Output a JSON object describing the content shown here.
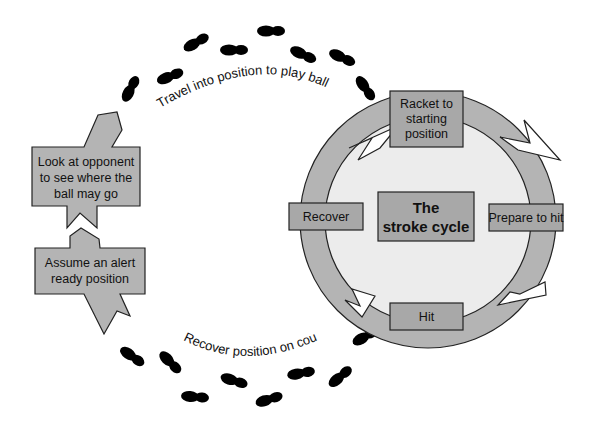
{
  "colors": {
    "box_fill": "#a8a8a8",
    "arrow_fill": "#b4b4b4",
    "inner_circle": "#ececec",
    "outline": "#222222",
    "footprint": "#000000"
  },
  "cycle": {
    "center_title_line1": "The",
    "center_title_line2": "stroke cycle",
    "steps": [
      {
        "id": "racket",
        "lines": [
          "Racket to",
          "starting",
          "position"
        ]
      },
      {
        "id": "prepare",
        "lines": [
          "Prepare to hit"
        ]
      },
      {
        "id": "hit",
        "lines": [
          "Hit"
        ]
      },
      {
        "id": "recover",
        "lines": [
          "Recover"
        ]
      }
    ]
  },
  "outer_path": {
    "travel_label": "Travel into position to play ball",
    "recover_label": "Recover position on court",
    "look_box": [
      "Look at opponent",
      "to see where the",
      "ball may go"
    ],
    "ready_box": [
      "Assume an alert",
      "ready position"
    ]
  }
}
